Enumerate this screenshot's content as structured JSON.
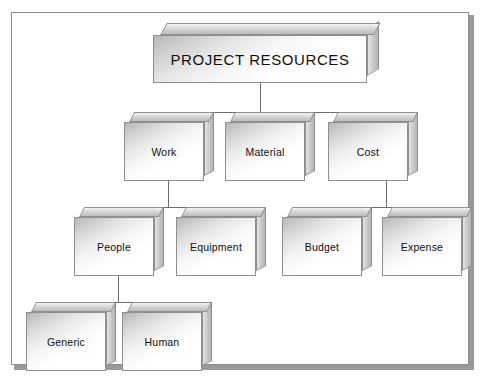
{
  "diagram": {
    "title": "PROJECT RESOURCES",
    "type": "hierarchy-3d-block-chart",
    "frame_color": "#8d8d8d",
    "connector_color": "#6e6e6e",
    "box_border_color": "#8f8f8f",
    "text_color": "#111111",
    "levels": [
      {
        "level": 1,
        "nodes": [
          {
            "id": "root",
            "label": "PROJECT RESOURCES"
          }
        ]
      },
      {
        "level": 2,
        "nodes": [
          {
            "id": "work",
            "label": "Work"
          },
          {
            "id": "material",
            "label": "Material"
          },
          {
            "id": "cost",
            "label": "Cost"
          }
        ]
      },
      {
        "level": 3,
        "nodes": [
          {
            "id": "people",
            "label": "People"
          },
          {
            "id": "equipment",
            "label": "Equipment"
          },
          {
            "id": "budget",
            "label": "Budget"
          },
          {
            "id": "expense",
            "label": "Expense"
          }
        ]
      },
      {
        "level": 4,
        "nodes": [
          {
            "id": "generic",
            "label": "Generic"
          },
          {
            "id": "human",
            "label": "Human"
          }
        ]
      }
    ],
    "edges": [
      {
        "from": "root",
        "to": "work"
      },
      {
        "from": "root",
        "to": "material"
      },
      {
        "from": "root",
        "to": "cost"
      },
      {
        "from": "work",
        "to": "people"
      },
      {
        "from": "work",
        "to": "equipment"
      },
      {
        "from": "cost",
        "to": "budget"
      },
      {
        "from": "cost",
        "to": "expense"
      },
      {
        "from": "people",
        "to": "generic"
      },
      {
        "from": "people",
        "to": "human"
      }
    ]
  }
}
